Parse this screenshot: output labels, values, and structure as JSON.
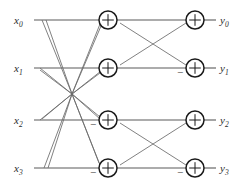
{
  "diagram": {
    "type": "signal-flow-graph",
    "stages": 2,
    "line_color": "#5a5a5a",
    "cross_color": "#6a6a6a",
    "node_color": "#1a1a1a",
    "background": "#ffffff",
    "inputs": [
      {
        "name": "x0",
        "base": "x",
        "sub": "0",
        "y": 20
      },
      {
        "name": "x1",
        "base": "x",
        "sub": "1",
        "y": 68
      },
      {
        "name": "x2",
        "base": "x",
        "sub": "2",
        "y": 120
      },
      {
        "name": "x3",
        "base": "x",
        "sub": "3",
        "y": 168
      }
    ],
    "outputs": [
      {
        "name": "y0",
        "base": "y",
        "sub": "0",
        "y": 20
      },
      {
        "name": "y1",
        "base": "y",
        "sub": "1",
        "y": 68
      },
      {
        "name": "y2",
        "base": "y",
        "sub": "2",
        "y": 120
      },
      {
        "name": "y3",
        "base": "y",
        "sub": "3",
        "y": 168
      }
    ],
    "adders": [
      {
        "id": "adder-s1-r0",
        "stage": 1,
        "row": 0,
        "cx": 108,
        "cy": 20,
        "r": 9,
        "glyph": "plus",
        "minus": false
      },
      {
        "id": "adder-s1-r1",
        "stage": 1,
        "row": 1,
        "cx": 108,
        "cy": 68,
        "r": 9,
        "glyph": "plus",
        "minus": false
      },
      {
        "id": "adder-s1-r2",
        "stage": 1,
        "row": 2,
        "cx": 108,
        "cy": 120,
        "r": 9,
        "glyph": "plus",
        "minus": true
      },
      {
        "id": "adder-s1-r3",
        "stage": 1,
        "row": 3,
        "cx": 108,
        "cy": 168,
        "r": 9,
        "glyph": "plus",
        "minus": true
      },
      {
        "id": "adder-s2-r0",
        "stage": 2,
        "row": 0,
        "cx": 195,
        "cy": 20,
        "r": 9,
        "glyph": "plus",
        "minus": false
      },
      {
        "id": "adder-s2-r1",
        "stage": 2,
        "row": 1,
        "cx": 195,
        "cy": 68,
        "r": 9,
        "glyph": "plus",
        "minus": true
      },
      {
        "id": "adder-s2-r2",
        "stage": 2,
        "row": 2,
        "cx": 195,
        "cy": 120,
        "r": 9,
        "glyph": "plus",
        "minus": false
      },
      {
        "id": "adder-s2-r3",
        "stage": 2,
        "row": 3,
        "cx": 195,
        "cy": 168,
        "r": 9,
        "glyph": "plus",
        "minus": true
      }
    ],
    "minus_label": "−",
    "crossings": {
      "stage1_hub": {
        "x": 72,
        "y": 94,
        "description": "all stage-1 diagonals pass through a common center"
      },
      "stage2_upper": {
        "x": 152,
        "y": 44
      },
      "stage2_lower": {
        "x": 152,
        "y": 144
      }
    },
    "edges": [
      {
        "from": "x0",
        "to": "adder-s1-r0",
        "kind": "straight"
      },
      {
        "from": "x1",
        "to": "adder-s1-r1",
        "kind": "straight"
      },
      {
        "from": "x2",
        "to": "adder-s1-r2",
        "kind": "straight"
      },
      {
        "from": "x3",
        "to": "adder-s1-r3",
        "kind": "straight"
      },
      {
        "from": "x0",
        "to": "adder-s1-r2",
        "kind": "diagonal"
      },
      {
        "from": "x0",
        "to": "adder-s1-r3",
        "kind": "diagonal"
      },
      {
        "from": "x1",
        "to": "adder-s1-r2",
        "kind": "diagonal"
      },
      {
        "from": "x1",
        "to": "adder-s1-r3",
        "kind": "diagonal"
      },
      {
        "from": "x2",
        "to": "adder-s1-r0",
        "kind": "diagonal"
      },
      {
        "from": "x2",
        "to": "adder-s1-r1",
        "kind": "diagonal"
      },
      {
        "from": "x3",
        "to": "adder-s1-r0",
        "kind": "diagonal"
      },
      {
        "from": "x3",
        "to": "adder-s1-r1",
        "kind": "diagonal"
      },
      {
        "from": "adder-s1-r0",
        "to": "adder-s2-r0",
        "kind": "straight"
      },
      {
        "from": "adder-s1-r1",
        "to": "adder-s2-r1",
        "kind": "straight"
      },
      {
        "from": "adder-s1-r2",
        "to": "adder-s2-r2",
        "kind": "straight"
      },
      {
        "from": "adder-s1-r3",
        "to": "adder-s2-r3",
        "kind": "straight"
      },
      {
        "from": "adder-s1-r0",
        "to": "adder-s2-r1",
        "kind": "cross"
      },
      {
        "from": "adder-s1-r1",
        "to": "adder-s2-r0",
        "kind": "cross"
      },
      {
        "from": "adder-s1-r2",
        "to": "adder-s2-r3",
        "kind": "cross"
      },
      {
        "from": "adder-s1-r3",
        "to": "adder-s2-r2",
        "kind": "cross"
      },
      {
        "from": "adder-s2-r0",
        "to": "y0",
        "kind": "straight"
      },
      {
        "from": "adder-s2-r1",
        "to": "y1",
        "kind": "straight"
      },
      {
        "from": "adder-s2-r2",
        "to": "y2",
        "kind": "straight"
      },
      {
        "from": "adder-s2-r3",
        "to": "y3",
        "kind": "straight"
      }
    ]
  }
}
